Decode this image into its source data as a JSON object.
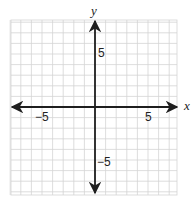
{
  "chart_data": {
    "type": "scatter",
    "title": "",
    "xlabel": "x",
    "ylabel": "y",
    "xlim": [
      -8,
      8
    ],
    "ylim": [
      -8,
      8
    ],
    "grid": true,
    "grid_step": 1,
    "x_tick_labels": [
      {
        "value": -5,
        "label": "−5"
      },
      {
        "value": 5,
        "label": "5"
      }
    ],
    "y_tick_labels": [
      {
        "value": 5,
        "label": "5"
      },
      {
        "value": -5,
        "label": "−5"
      }
    ],
    "series": [],
    "legend": null
  },
  "colors": {
    "grid": "#d4d4d4",
    "axis": "#1e1e1e",
    "background": "#ffffff"
  },
  "labels": {
    "x_axis": "x",
    "y_axis": "y",
    "x_neg5": "−5",
    "x_pos5": "5",
    "y_pos5": "5",
    "y_neg5": "−5"
  }
}
